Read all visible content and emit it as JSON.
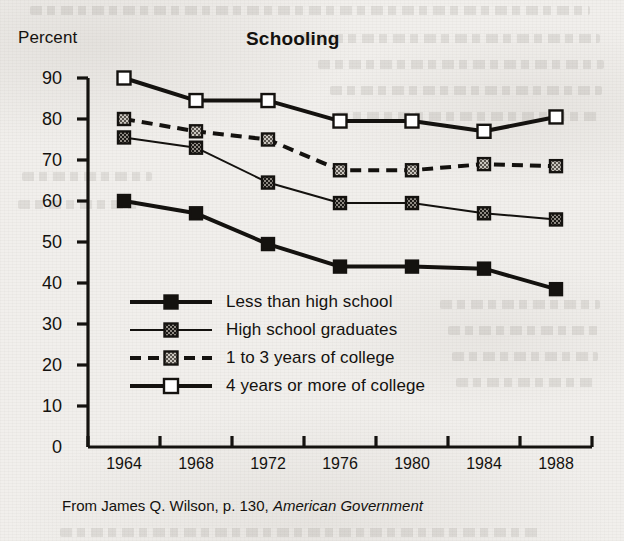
{
  "chart_data": {
    "type": "line",
    "title": "Schooling",
    "xlabel": "",
    "ylabel": "Percent",
    "x": [
      1964,
      1968,
      1972,
      1976,
      1980,
      1984,
      1988
    ],
    "xtick_labels": [
      "1964",
      "1968",
      "1972",
      "1976",
      "1980",
      "1984",
      "1988"
    ],
    "ylim": [
      0,
      90
    ],
    "ytick_labels": [
      "0",
      "10",
      "20",
      "30",
      "40",
      "50",
      "60",
      "70",
      "80",
      "90"
    ],
    "ytick_values": [
      0,
      10,
      20,
      30,
      40,
      50,
      60,
      70,
      80,
      90
    ],
    "grid": false,
    "legend_position": "inside-lower-left",
    "series": [
      {
        "name": "Less than high school",
        "values": [
          60,
          57,
          49.5,
          44,
          44,
          43.5,
          38.5
        ],
        "marker": "filled-square",
        "marker_fill": "#141210",
        "line_style": "solid",
        "line_width": 4
      },
      {
        "name": "High school graduates",
        "values": [
          75.5,
          73,
          64.5,
          59.5,
          59.5,
          57,
          55.5
        ],
        "marker": "dark-checkered-square",
        "marker_fill": "#4a4540",
        "line_style": "solid",
        "line_width": 2
      },
      {
        "name": "1 to 3 years of college",
        "values": [
          80,
          77,
          75,
          67.5,
          67.5,
          69,
          68.5
        ],
        "marker": "light-checkered-square",
        "marker_fill": "#9a958e",
        "line_style": "dashed",
        "line_width": 4
      },
      {
        "name": "4 years or more of college",
        "values": [
          90,
          84.5,
          84.5,
          79.5,
          79.5,
          77,
          80.5
        ],
        "marker": "hollow-square",
        "marker_fill": "#ffffff",
        "line_style": "solid",
        "line_width": 4
      }
    ],
    "source_note_prefix": "From James Q. Wilson, p. 130, ",
    "source_note_book": "American Government"
  },
  "colors": {
    "ink": "#14120f",
    "paper": "#f1efec",
    "marker_dark": "#4a4540",
    "marker_light": "#9a958e"
  }
}
